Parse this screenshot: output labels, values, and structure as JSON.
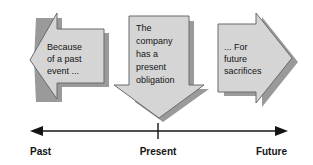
{
  "diagram": {
    "colors": {
      "arrow_fill": "#d5d5d5",
      "arrow_outline": "#6b6b6b",
      "arrow_shadow": "#9a9a9a",
      "ink": "#141414",
      "background": "#ffffff"
    },
    "arrows": [
      {
        "id": "past-arrow",
        "direction": "left",
        "lines": [
          "Because",
          "of a past",
          "event ..."
        ]
      },
      {
        "id": "present-arrow",
        "direction": "down",
        "lines": [
          "The",
          "company",
          "has a",
          "present",
          "obligation"
        ]
      },
      {
        "id": "future-arrow",
        "direction": "right",
        "lines": [
          "... For",
          "future",
          "sacrifices"
        ]
      }
    ],
    "timeline": {
      "labels": [
        {
          "id": "past",
          "text": "Past"
        },
        {
          "id": "present",
          "text": "Present"
        },
        {
          "id": "future",
          "text": "Future"
        }
      ]
    }
  }
}
